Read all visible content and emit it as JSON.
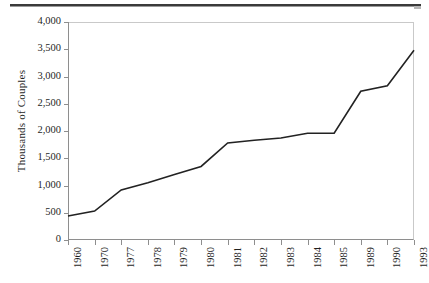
{
  "page": {
    "rule_present": true
  },
  "chart_data": {
    "type": "line",
    "title": "",
    "xlabel": "",
    "ylabel": "Thousands of Couples",
    "categories": [
      "1960",
      "1970",
      "1977",
      "1978",
      "1979",
      "1980",
      "1981",
      "1982",
      "1983",
      "1984",
      "1985",
      "1989",
      "1990",
      "1993"
    ],
    "values": [
      440,
      530,
      920,
      1050,
      1200,
      1350,
      1780,
      1830,
      1870,
      1960,
      1960,
      2730,
      2830,
      3480
    ],
    "series": [
      {
        "name": "Unmarried couple households",
        "values": [
          440,
          530,
          920,
          1050,
          1200,
          1350,
          1780,
          1830,
          1870,
          1960,
          1960,
          2730,
          2830,
          3480
        ]
      }
    ],
    "ylim": [
      0,
      4000
    ],
    "yticks": [
      0,
      500,
      1000,
      1500,
      2000,
      2500,
      3000,
      3500,
      4000
    ],
    "ytick_labels": [
      "0",
      "500",
      "1,000",
      "1,500",
      "2,000",
      "2,500",
      "3,000",
      "3,500",
      "4,000"
    ],
    "grid": false,
    "legend": "none",
    "line_color": "#222222",
    "line_width": 1.6
  }
}
